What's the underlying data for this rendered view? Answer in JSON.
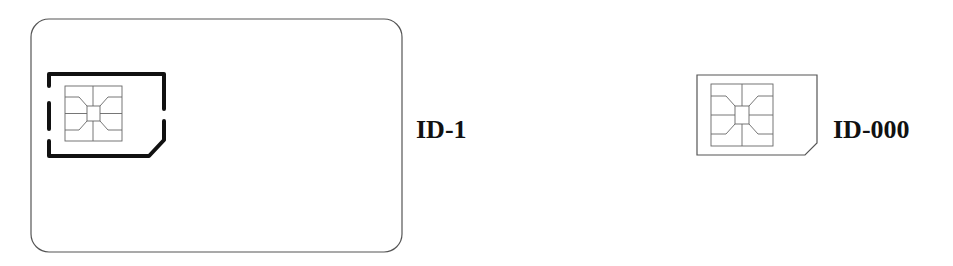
{
  "diagram": {
    "cards": [
      {
        "label": "ID-1",
        "description": "Full-size card with punch-out ID-000 SIM outline and contact chip"
      },
      {
        "label": "ID-000",
        "description": "Mini-SIM with clipped corner and contact chip"
      }
    ],
    "colors": {
      "card_outline": "#555555",
      "cutout_outline": "#111111",
      "chip_lines": "#666666",
      "label_text": "#111111",
      "background": "#ffffff"
    }
  }
}
